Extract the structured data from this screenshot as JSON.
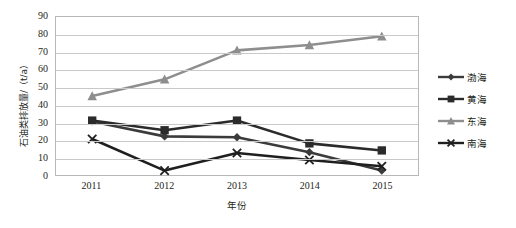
{
  "chart_data": {
    "type": "line",
    "title": "",
    "xlabel": "年份",
    "ylabel": "石油类排放量/（t/a）",
    "categories": [
      "2011",
      "2012",
      "2013",
      "2014",
      "2015"
    ],
    "x": [
      2011,
      2012,
      2013,
      2014,
      2015
    ],
    "ylim": [
      0,
      90
    ],
    "ytick_step": 10,
    "yticks": [
      "90",
      "80",
      "70",
      "60",
      "50",
      "40",
      "30",
      "20",
      "10",
      "0"
    ],
    "grid": true,
    "legend_position": "right",
    "series": [
      {
        "name": "渤海",
        "values": [
          30.5,
          22.0,
          21.5,
          13.0,
          2.5
        ],
        "color": "#3b3b3b",
        "marker": "diamond"
      },
      {
        "name": "黄海",
        "values": [
          31.0,
          25.5,
          31.0,
          18.0,
          14.0
        ],
        "color": "#2b2b2b",
        "marker": "square"
      },
      {
        "name": "东海",
        "values": [
          45.0,
          54.5,
          71.0,
          74.0,
          79.0
        ],
        "color": "#8e8e8e",
        "marker": "triangle"
      },
      {
        "name": "南海",
        "values": [
          20.5,
          2.5,
          12.5,
          8.5,
          5.0
        ],
        "color": "#1f1f1f",
        "marker": "x"
      }
    ]
  },
  "legend": {
    "items": [
      {
        "label": "渤海"
      },
      {
        "label": "黄海"
      },
      {
        "label": "东海"
      },
      {
        "label": "南海"
      }
    ]
  },
  "axes": {
    "y_title": "石油类排放量/（t/a）",
    "x_title": "年份"
  }
}
